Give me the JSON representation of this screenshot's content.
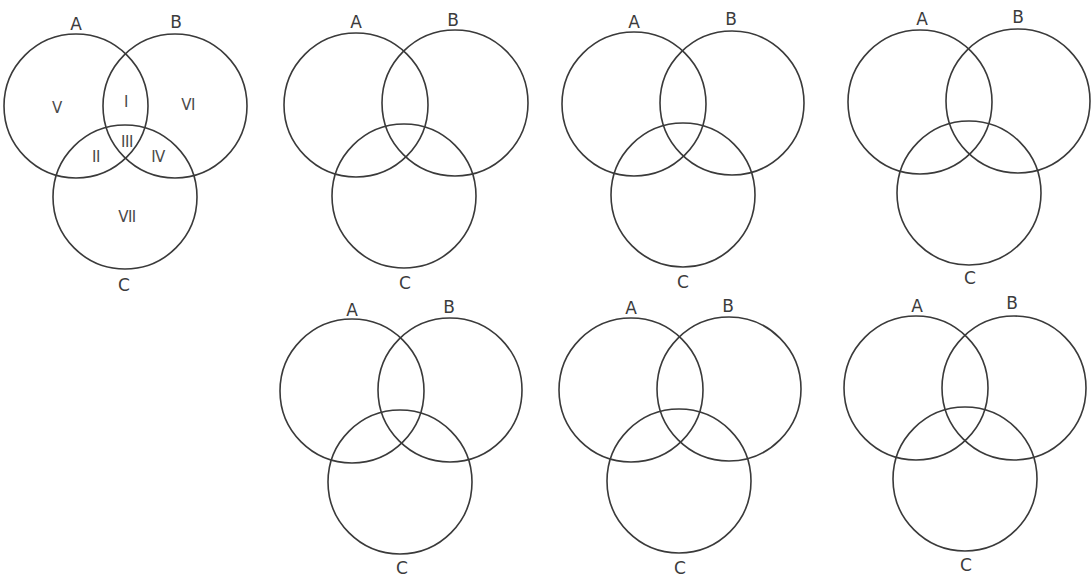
{
  "colors": {
    "background": "#ffffff",
    "stroke": "#3a3a3a",
    "text": "#3c3c3c"
  },
  "diagrams": [
    {
      "id": "reference",
      "circles": [
        {
          "set": "A",
          "cx": 76,
          "cy": 106,
          "r": 72,
          "label": "A",
          "label_x": 76,
          "label_y": 24
        },
        {
          "set": "B",
          "cx": 175,
          "cy": 106,
          "r": 72,
          "label": "B",
          "label_x": 176,
          "label_y": 22
        },
        {
          "set": "C",
          "cx": 125,
          "cy": 197,
          "r": 72,
          "label": "C",
          "label_x": 124,
          "label_y": 285
        }
      ],
      "regions": [
        {
          "label": "I",
          "x": 126,
          "y": 102
        },
        {
          "label": "II",
          "x": 96,
          "y": 157
        },
        {
          "label": "III",
          "x": 127,
          "y": 142
        },
        {
          "label": "IV",
          "x": 158,
          "y": 157
        },
        {
          "label": "V",
          "x": 57,
          "y": 108
        },
        {
          "label": "VI",
          "x": 188,
          "y": 105
        },
        {
          "label": "VII",
          "x": 127,
          "y": 217
        }
      ]
    },
    {
      "id": "blank-1",
      "circles": [
        {
          "set": "A",
          "cx": 356,
          "cy": 105,
          "r": 72,
          "label": "A",
          "label_x": 356,
          "label_y": 22
        },
        {
          "set": "B",
          "cx": 455,
          "cy": 103,
          "r": 73,
          "label": "B",
          "label_x": 453,
          "label_y": 20
        },
        {
          "set": "C",
          "cx": 404,
          "cy": 196,
          "r": 72,
          "label": "C",
          "label_x": 405,
          "label_y": 283
        }
      ],
      "regions": []
    },
    {
      "id": "blank-2",
      "circles": [
        {
          "set": "A",
          "cx": 634,
          "cy": 104,
          "r": 72,
          "label": "A",
          "label_x": 634,
          "label_y": 22
        },
        {
          "set": "B",
          "cx": 732,
          "cy": 103,
          "r": 72,
          "label": "B",
          "label_x": 731,
          "label_y": 19
        },
        {
          "set": "C",
          "cx": 683,
          "cy": 195,
          "r": 72,
          "label": "C",
          "label_x": 683,
          "label_y": 282
        }
      ],
      "regions": []
    },
    {
      "id": "blank-3",
      "circles": [
        {
          "set": "A",
          "cx": 920,
          "cy": 102,
          "r": 72,
          "label": "A",
          "label_x": 922,
          "label_y": 19
        },
        {
          "set": "B",
          "cx": 1018,
          "cy": 101,
          "r": 72,
          "label": "B",
          "label_x": 1018,
          "label_y": 17
        },
        {
          "set": "C",
          "cx": 969,
          "cy": 193,
          "r": 72,
          "label": "C",
          "label_x": 970,
          "label_y": 278
        }
      ],
      "regions": []
    },
    {
      "id": "blank-4",
      "circles": [
        {
          "set": "A",
          "cx": 352,
          "cy": 391,
          "r": 72,
          "label": "A",
          "label_x": 352,
          "label_y": 310
        },
        {
          "set": "B",
          "cx": 450,
          "cy": 390,
          "r": 72,
          "label": "B",
          "label_x": 449,
          "label_y": 307
        },
        {
          "set": "C",
          "cx": 400,
          "cy": 482,
          "r": 72,
          "label": "C",
          "label_x": 402,
          "label_y": 568
        }
      ],
      "regions": []
    },
    {
      "id": "blank-5",
      "circles": [
        {
          "set": "A",
          "cx": 631,
          "cy": 390,
          "r": 72,
          "label": "A",
          "label_x": 631,
          "label_y": 308
        },
        {
          "set": "B",
          "cx": 729,
          "cy": 389,
          "r": 72,
          "label": "B",
          "label_x": 728,
          "label_y": 306
        },
        {
          "set": "C",
          "cx": 679,
          "cy": 481,
          "r": 72,
          "label": "C",
          "label_x": 680,
          "label_y": 568
        }
      ],
      "regions": []
    },
    {
      "id": "blank-6",
      "circles": [
        {
          "set": "A",
          "cx": 916,
          "cy": 388,
          "r": 72,
          "label": "A",
          "label_x": 917,
          "label_y": 306
        },
        {
          "set": "B",
          "cx": 1014,
          "cy": 388,
          "r": 72,
          "label": "B",
          "label_x": 1012,
          "label_y": 303
        },
        {
          "set": "C",
          "cx": 965,
          "cy": 479,
          "r": 72,
          "label": "C",
          "label_x": 966,
          "label_y": 565
        }
      ],
      "regions": []
    }
  ]
}
